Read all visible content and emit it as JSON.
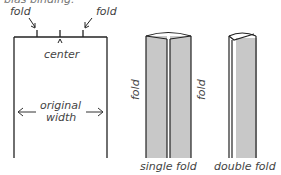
{
  "header": {
    "cropped_text": "bias binding."
  },
  "left_panel": {
    "labels": {
      "fold_left": "fold",
      "fold_right": "fold",
      "center": "center",
      "original_width_line1": "original",
      "original_width_line2": "width"
    }
  },
  "middle_panel": {
    "caption": "single fold",
    "side_label_left": "fold",
    "side_label_right": "fold"
  },
  "right_panel": {
    "caption": "double fold"
  },
  "colors": {
    "line": "#222222",
    "fill": "#c8c8c8",
    "text": "#444444"
  }
}
